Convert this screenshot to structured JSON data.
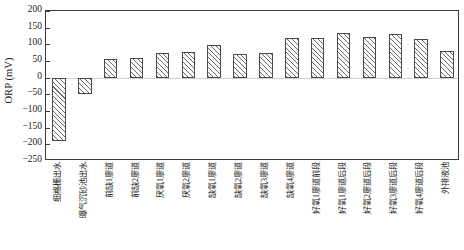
{
  "chart_data": {
    "type": "bar",
    "title": "",
    "xlabel": "",
    "ylabel": "ORP (mV)",
    "ylim": [
      -250,
      200
    ],
    "yticks": [
      200,
      150,
      100,
      50,
      0,
      -50,
      -100,
      -150,
      -200,
      -250
    ],
    "ytick_labels": [
      "200",
      "150",
      "100",
      "50",
      "0",
      "−50",
      "−100",
      "−150",
      "−200",
      "−250"
    ],
    "grid": false,
    "legend": false,
    "bar_fill": "diagonal-hatch",
    "categories": [
      "细格栅出水",
      "曝气沉砂池出水",
      "前缺1廖道",
      "前缺2廖道",
      "厌氧1廖道",
      "厌氧2廖道",
      "缺氧1廖道",
      "缺氧2廖道",
      "缺氧3廖道",
      "缺氧4廖道",
      "好氧1廖道前段",
      "好氧1廖道后段",
      "好氧2廖道后段",
      "好氧3廖道后段",
      "好氧4廖道后段",
      "外排液池"
    ],
    "values": [
      -190,
      -48,
      55,
      60,
      75,
      76,
      98,
      70,
      73,
      120,
      120,
      135,
      122,
      130,
      115,
      80
    ]
  }
}
